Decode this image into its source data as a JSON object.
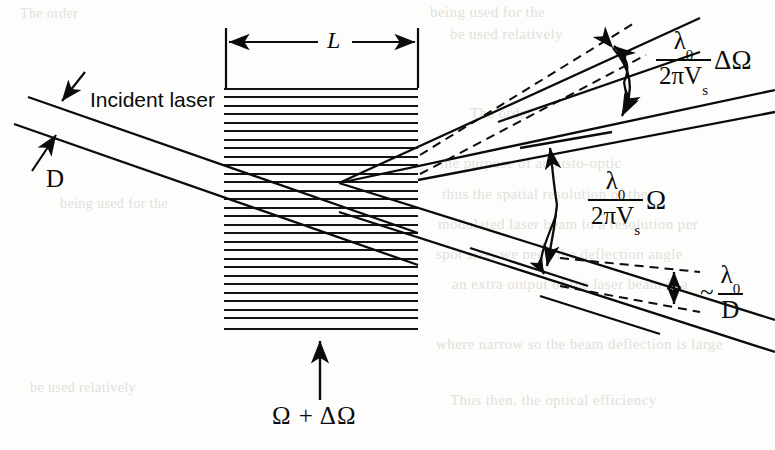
{
  "figure": {
    "kind": "acousto-optic-bragg-cell-diagram",
    "background_color": "#fdfdfb",
    "ink_color": "#0b0b0b",
    "ghost_color": "#c9c9c4"
  },
  "labels": {
    "incident_laser": "Incident laser",
    "aperture_D": "D",
    "cell_length_L": "L",
    "acoustic_drive": "Ω + ΔΩ"
  },
  "formulas": {
    "delta_omega_spread": {
      "prefix": "",
      "numerator": "λ",
      "numerator_sub": "0",
      "denominator": "2πV",
      "denominator_sub": "s",
      "tail": "ΔΩ",
      "plain": "λ0 / (2πVs) ΔΩ"
    },
    "omega_deflection": {
      "prefix": "",
      "numerator": "λ",
      "numerator_sub": "0",
      "denominator": "2πV",
      "denominator_sub": "s",
      "tail": "Ω",
      "plain": "λ0 / (2πVs) Ω"
    },
    "diffraction_limit": {
      "prefix": "~",
      "numerator": "λ",
      "numerator_sub": "0",
      "denominator": "D",
      "denominator_sub": "",
      "tail": "",
      "plain": "~ λ0 / D"
    }
  },
  "grating": {
    "x_left": 224,
    "x_right": 418,
    "y_top": 88,
    "y_bottom": 331,
    "line_count": 29,
    "line_spacing": 8.5,
    "line_color": "#141414"
  },
  "dimension_line": {
    "y": 42,
    "x_start": 226,
    "x_end": 418,
    "tick_top": 28,
    "tick_bottom": 88
  },
  "ghost_text": {
    "rows": [
      "being used for the",
      "be used relatively",
      "The order",
      "the purpose of acousto-optic",
      "thus the spatial resolution of the",
      "modulated laser beam to a resolution per",
      "spot size, we need the deflection angle",
      "an extra output of the laser beam is a",
      "where narrow so the beam deflection is large",
      "Thus then, the optical efficiency"
    ]
  }
}
